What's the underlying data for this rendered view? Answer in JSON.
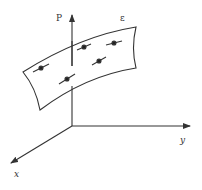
{
  "diagram": {
    "type": "3d-coordinate-surface",
    "labels": {
      "p_axis": "P",
      "surface": "ε",
      "y_axis": "y",
      "x_axis": "x"
    },
    "colors": {
      "stroke": "#333333",
      "background": "#ffffff"
    },
    "points": [
      {
        "x": 41,
        "y": 68
      },
      {
        "x": 67,
        "y": 79
      },
      {
        "x": 84,
        "y": 47
      },
      {
        "x": 114,
        "y": 43
      },
      {
        "x": 99,
        "y": 61
      }
    ]
  }
}
